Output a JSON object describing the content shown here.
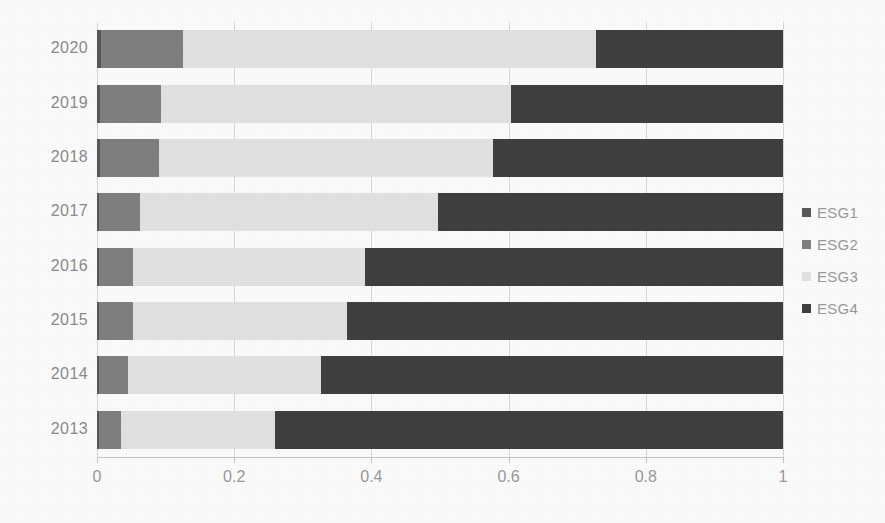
{
  "chart_data": {
    "type": "bar",
    "orientation": "horizontal",
    "stacked": true,
    "normalized": true,
    "title": "",
    "subtitle": "",
    "xlabel": "",
    "ylabel": "",
    "xlim": [
      0,
      1
    ],
    "xticks": [
      0,
      0.2,
      0.4,
      0.6,
      0.8,
      1
    ],
    "xtick_labels": [
      "0",
      "0.2",
      "0.4",
      "0.6",
      "0.8",
      "1"
    ],
    "grid": true,
    "grid_axis": "x",
    "legend_position": "right",
    "categories": [
      "2020",
      "2019",
      "2018",
      "2017",
      "2016",
      "2015",
      "2014",
      "2013"
    ],
    "series": [
      {
        "name": "ESG1",
        "color": "#595959",
        "values": [
          0.006,
          0.005,
          0.004,
          0.003,
          0.003,
          0.003,
          0.003,
          0.003
        ]
      },
      {
        "name": "ESG2",
        "color": "#808080",
        "values": [
          0.119,
          0.088,
          0.086,
          0.06,
          0.05,
          0.049,
          0.042,
          0.032
        ]
      },
      {
        "name": "ESG3",
        "color": "#e3e3e3",
        "values": [
          0.602,
          0.51,
          0.487,
          0.434,
          0.337,
          0.313,
          0.282,
          0.225
        ]
      },
      {
        "name": "ESG4",
        "color": "#404040",
        "values": [
          0.273,
          0.397,
          0.423,
          0.503,
          0.61,
          0.635,
          0.673,
          0.74
        ]
      }
    ],
    "cumulative_boundaries": {
      "2020": [
        0.006,
        0.125,
        0.727,
        1.0
      ],
      "2019": [
        0.005,
        0.093,
        0.603,
        1.0
      ],
      "2018": [
        0.004,
        0.09,
        0.577,
        1.0
      ],
      "2017": [
        0.003,
        0.063,
        0.497,
        1.0
      ],
      "2016": [
        0.003,
        0.053,
        0.39,
        1.0
      ],
      "2015": [
        0.003,
        0.052,
        0.365,
        1.0
      ],
      "2014": [
        0.003,
        0.045,
        0.327,
        1.0
      ],
      "2013": [
        0.003,
        0.035,
        0.26,
        1.0
      ]
    }
  },
  "legend": {
    "items": [
      {
        "label": "ESG1",
        "color": "#595959"
      },
      {
        "label": "ESG2",
        "color": "#808080"
      },
      {
        "label": "ESG3",
        "color": "#e3e3e3"
      },
      {
        "label": "ESG4",
        "color": "#404040"
      }
    ]
  },
  "colors": {
    "background": "#fdfdfd",
    "gridline": "#d9d9d9",
    "axis_text": "#9a9a9a",
    "category_text": "#8c8c8c"
  }
}
